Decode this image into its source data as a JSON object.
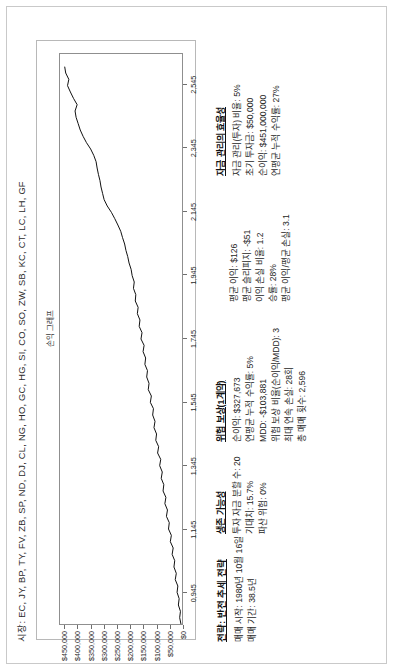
{
  "document": {
    "market_line": "시장: EC, JY, BP, TY, FV, ZB, SP, ND, DJ, CL, NG, HO, GC, HG, SI, CO, SO, ZW, SB, KC, CT, LC, LH, GF"
  },
  "header": {
    "strategy_label": "전략: 반전 추세 전략",
    "start_date": "매매 시작: 1980년 10월 16일",
    "duration": "매매 기간: 38.5년"
  },
  "sections": {
    "survivability": {
      "title": "생존 가능성",
      "lines": [
        "투자 자금 분할 수: 20",
        "기대치: 15.7%",
        "파산 위험: 0%"
      ]
    },
    "risk_reward": {
      "title": "위험 보상(1계약)",
      "lines": [
        "순이익: $327,673",
        "연평균 누적 수익률: 5%",
        "MDD: -$103,881",
        "위험 보상 비율(순이익/MDD): 3",
        "최대 연속 손실: 28회",
        "총 매매 횟수: 2,596",
        "평균 이익: $126",
        "평균 슬리피지: -$51",
        "이익 손실 비율: 1.2",
        "승률: 28%",
        "평균 이익/평균 손실: 3.1"
      ]
    },
    "capital_management": {
      "title": "자금 관리의 효율성",
      "lines": [
        "자금 관리(투자) 비율: 5%",
        "초기 투자금: $50,000",
        "순이익: $451,000,000",
        "연평균 누적 수익률: 27%"
      ]
    }
  },
  "chart_data": {
    "type": "line",
    "title": "손익 그래프",
    "xlabel": "",
    "ylabel": "",
    "grid": false,
    "legend": "none",
    "ylim": [
      0,
      470000
    ],
    "ytick_labels": [
      "$450,000",
      "$400,000",
      "$350,000",
      "$300,000",
      "$250,000",
      "$200,000",
      "$150,000",
      "$100,000",
      "$50,000",
      "$0"
    ],
    "ytick_values": [
      450000,
      400000,
      350000,
      300000,
      250000,
      200000,
      150000,
      100000,
      50000,
      0
    ],
    "xlim": [
      845,
      2645
    ],
    "xtick_labels": [
      "2,545",
      "2,345",
      "2,145",
      "1,945",
      "1,745",
      "1,545",
      "1,345",
      "1,145",
      "0,945"
    ],
    "xtick_values": [
      2545,
      2345,
      2145,
      1945,
      1745,
      1545,
      1345,
      1145,
      945
    ],
    "series": [
      {
        "name": "누적 손익",
        "x": [
          845,
          865,
          885,
          905,
          925,
          945,
          965,
          985,
          1005,
          1025,
          1045,
          1065,
          1085,
          1105,
          1125,
          1145,
          1165,
          1185,
          1205,
          1225,
          1245,
          1265,
          1285,
          1305,
          1325,
          1345,
          1365,
          1385,
          1405,
          1425,
          1445,
          1465,
          1485,
          1505,
          1525,
          1545,
          1565,
          1585,
          1605,
          1625,
          1645,
          1665,
          1685,
          1705,
          1725,
          1745,
          1765,
          1785,
          1805,
          1825,
          1845,
          1865,
          1885,
          1905,
          1925,
          1945,
          1965,
          1985,
          2005,
          2025,
          2045,
          2065,
          2085,
          2105,
          2125,
          2145,
          2165,
          2185,
          2205,
          2225,
          2245,
          2265,
          2285,
          2305,
          2325,
          2345,
          2365,
          2385,
          2405,
          2425,
          2445,
          2465,
          2485,
          2505,
          2525,
          2545,
          2565,
          2585,
          2605
        ],
        "y": [
          4000,
          9000,
          6000,
          14000,
          11000,
          19000,
          16000,
          26000,
          22000,
          31000,
          28000,
          38000,
          34000,
          45000,
          41000,
          52000,
          49000,
          60000,
          56000,
          66000,
          62000,
          73000,
          70000,
          80000,
          76000,
          86000,
          82000,
          94000,
          90000,
          101000,
          98000,
          108000,
          104000,
          113000,
          110000,
          122000,
          118000,
          130000,
          127000,
          136000,
          133000,
          143000,
          140000,
          150000,
          146000,
          158000,
          154000,
          165000,
          162000,
          172000,
          169000,
          180000,
          178000,
          187000,
          184000,
          192000,
          196000,
          204000,
          209000,
          216000,
          221000,
          229000,
          236000,
          247000,
          259000,
          272000,
          288000,
          300000,
          306000,
          312000,
          316000,
          322000,
          327000,
          331000,
          340000,
          352000,
          368000,
          381000,
          392000,
          400000,
          408000,
          412000,
          404000,
          418000,
          430000,
          441000,
          436000,
          448000,
          452000
        ]
      }
    ]
  }
}
